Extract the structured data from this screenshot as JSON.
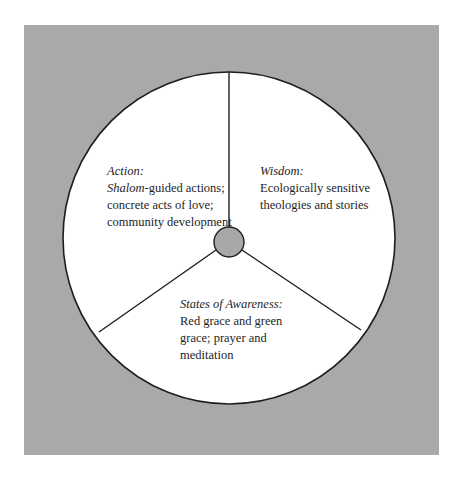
{
  "diagram": {
    "type": "three-segment circle with central hub",
    "colors": {
      "background": "#ffffff",
      "frame": "#a9a9a9",
      "circle_fill": "#ffffff",
      "stroke": "#1e1e1e",
      "hub_fill": "#a8a8a8"
    },
    "segments": [
      {
        "heading": "Action:",
        "lines": [
          {
            "italic_prefix": "Shalom",
            "text": "-guided actions;"
          },
          {
            "text": "concrete acts of love;"
          },
          {
            "text": "community development"
          }
        ]
      },
      {
        "heading": "Wisdom:",
        "lines": [
          {
            "text": "Ecologically sensitive"
          },
          {
            "text": "theologies and stories"
          }
        ]
      },
      {
        "heading": "States of Awareness:",
        "lines": [
          {
            "text": "Red grace and green"
          },
          {
            "text": "grace; prayer and"
          },
          {
            "text": "meditation"
          }
        ]
      }
    ]
  }
}
